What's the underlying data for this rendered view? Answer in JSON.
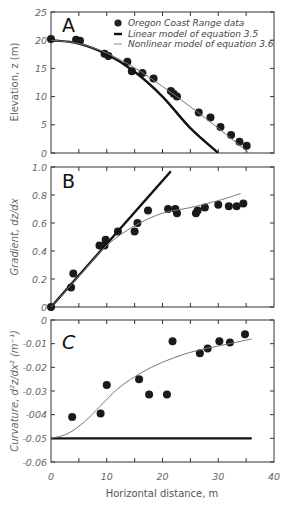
{
  "chart_data": [
    {
      "type": "scatter",
      "panel": "A",
      "title": "A",
      "xlabel": "",
      "ylabel": "Elevation, z (m)",
      "xlim": [
        0,
        40
      ],
      "ylim": [
        0,
        25
      ],
      "yticks": [
        "0",
        "5",
        "10",
        "15",
        "20",
        "25"
      ],
      "legend": {
        "position": "upper right",
        "entries": [
          {
            "marker": "dot",
            "label": "Oregon Coast Range data"
          },
          {
            "marker": "thick-line",
            "label": "Linear model of equation 3.5"
          },
          {
            "marker": "thin-line",
            "label": "Nonlinear model of equation 3.6"
          }
        ]
      },
      "series": [
        {
          "name": "Oregon Coast Range data",
          "kind": "points",
          "x": [
            0,
            4.5,
            5.2,
            9.6,
            10.3,
            13.7,
            14.5,
            16.4,
            18.4,
            21.5,
            22.0,
            22.6,
            26.5,
            28.6,
            30.4,
            32.3,
            33.8,
            35.1
          ],
          "y": [
            20.2,
            20.1,
            19.9,
            17.6,
            17.2,
            16.2,
            14.5,
            14.2,
            13.2,
            11.0,
            10.5,
            10.0,
            7.2,
            6.3,
            4.6,
            3.2,
            2.0,
            1.3
          ]
        },
        {
          "name": "Linear model of equation 3.5",
          "kind": "thick-line",
          "x": [
            0,
            5,
            10,
            15,
            20,
            25,
            30
          ],
          "y": [
            20,
            19.4,
            17.5,
            14.4,
            10.0,
            4.4,
            0
          ]
        },
        {
          "name": "Nonlinear model of equation 3.6",
          "kind": "thin-line",
          "x": [
            0,
            5,
            10,
            15,
            20,
            25,
            30,
            35.5
          ],
          "y": [
            20,
            19.4,
            17.7,
            15.1,
            11.8,
            8.2,
            4.4,
            0
          ]
        }
      ]
    },
    {
      "type": "scatter",
      "panel": "B",
      "title": "B",
      "xlabel": "",
      "ylabel": "Gradient, dz/dx",
      "xlim": [
        0,
        40
      ],
      "ylim": [
        0,
        1.0
      ],
      "yticks": [
        "0",
        "0.2",
        "0.4",
        "0.6",
        "0.8",
        "1.0"
      ],
      "series": [
        {
          "name": "Oregon Coast Range data",
          "kind": "points",
          "x": [
            0,
            3.6,
            4.0,
            8.7,
            9.6,
            9.8,
            12.0,
            15.0,
            15.5,
            17.4,
            21.0,
            22.3,
            22.6,
            26.0,
            26.3,
            27.6,
            30.0,
            31.9,
            33.3,
            34.5
          ],
          "y": [
            0,
            0.14,
            0.24,
            0.44,
            0.44,
            0.48,
            0.54,
            0.54,
            0.6,
            0.69,
            0.7,
            0.7,
            0.67,
            0.67,
            0.69,
            0.71,
            0.73,
            0.72,
            0.72,
            0.74
          ]
        },
        {
          "name": "Linear model of equation 3.5",
          "kind": "thick-line",
          "x": [
            0,
            21.5
          ],
          "y": [
            0,
            0.97
          ]
        },
        {
          "name": "Nonlinear model of equation 3.6",
          "kind": "thin-line",
          "x": [
            0,
            5,
            10,
            15,
            20,
            25,
            30,
            34
          ],
          "y": [
            0,
            0.22,
            0.44,
            0.58,
            0.67,
            0.71,
            0.76,
            0.81
          ]
        }
      ]
    },
    {
      "type": "scatter",
      "panel": "C",
      "title": "C",
      "xlabel": "Horizontal distance, m",
      "ylabel": "Curvature, d²z/dx² (m⁻¹)",
      "xlim": [
        0,
        40
      ],
      "ylim": [
        -0.06,
        0
      ],
      "xticks": [
        "0",
        "10",
        "20",
        "30",
        "40"
      ],
      "yticks": [
        "-0.06",
        "-0.05",
        "-004",
        "-0.03",
        "-0.02",
        "-0.01",
        "0"
      ],
      "series": [
        {
          "name": "Oregon Coast Range data",
          "kind": "points",
          "x": [
            3.8,
            8.9,
            10.0,
            15.8,
            17.6,
            20.8,
            21.8,
            26.7,
            28.1,
            30.2,
            32.1,
            34.8
          ],
          "y": [
            -0.041,
            -0.0395,
            -0.0275,
            -0.025,
            -0.0315,
            -0.0315,
            -0.009,
            -0.014,
            -0.012,
            -0.009,
            -0.0095,
            -0.006
          ]
        },
        {
          "name": "Linear model of equation 3.5",
          "kind": "thick-line",
          "x": [
            0,
            36
          ],
          "y": [
            -0.05,
            -0.05
          ]
        },
        {
          "name": "Nonlinear model of equation 3.6",
          "kind": "thin-line",
          "x": [
            0,
            3,
            6,
            9,
            12,
            15,
            18,
            22,
            26,
            30,
            36
          ],
          "y": [
            -0.05,
            -0.048,
            -0.043,
            -0.036,
            -0.029,
            -0.024,
            -0.02,
            -0.016,
            -0.013,
            -0.011,
            -0.008
          ]
        }
      ]
    }
  ],
  "labels": {
    "panel_a": "A",
    "panel_b": "B",
    "panel_c": "C",
    "ylabel_a": "Elevation, z (m)",
    "ylabel_b": "Gradient, dz/dx",
    "ylabel_c": "Curvature, d²z/dx² (m⁻¹)",
    "xlabel": "Horizontal distance, m",
    "legend_data": "Oregon Coast Range data",
    "legend_linear": "Linear model of equation 3.5",
    "legend_nonlinear": "Nonlinear model of equation 3.6"
  }
}
